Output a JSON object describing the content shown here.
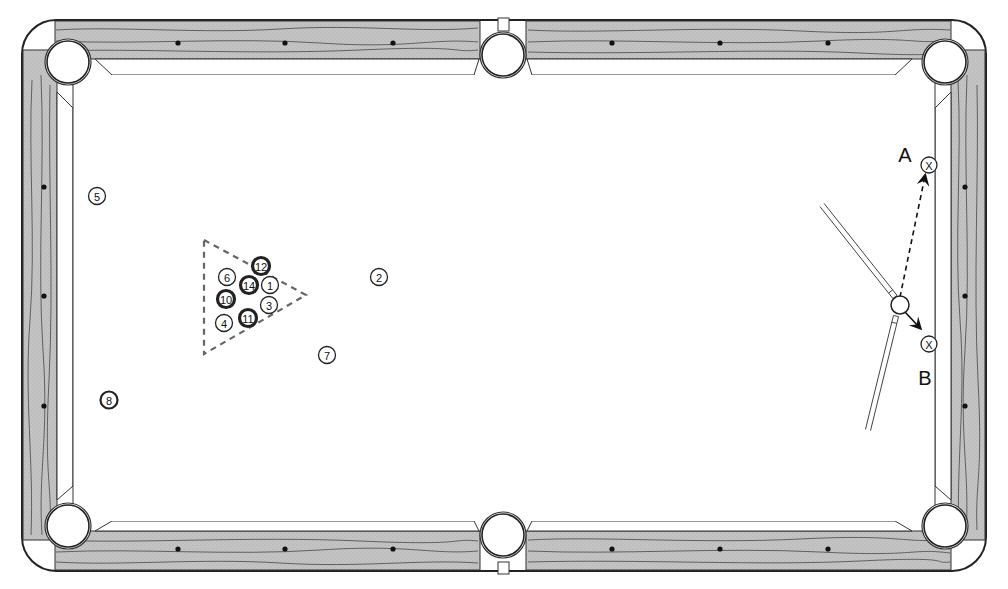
{
  "diagram": {
    "type": "pool-table-shot-diagram",
    "colors": {
      "rail_wood": "#bcbcbc",
      "outline": "#222222",
      "cloth": "#ffffff",
      "solid_ball_fill": "#ffffff",
      "dark_ball_fill": "#222222"
    },
    "pockets": [
      {
        "id": "top-left",
        "x": 68,
        "y": 62
      },
      {
        "id": "top-center",
        "x": 503,
        "y": 55
      },
      {
        "id": "top-right",
        "x": 945,
        "y": 62
      },
      {
        "id": "bottom-left",
        "x": 68,
        "y": 526
      },
      {
        "id": "bottom-center",
        "x": 503,
        "y": 535
      },
      {
        "id": "bottom-right",
        "x": 945,
        "y": 526
      }
    ],
    "balls": [
      {
        "number": "5",
        "x": 97,
        "y": 196,
        "style": "outline"
      },
      {
        "number": "8",
        "x": 109,
        "y": 400,
        "style": "bold"
      },
      {
        "number": "12",
        "x": 261,
        "y": 266,
        "style": "dark-ring"
      },
      {
        "number": "6",
        "x": 227,
        "y": 277,
        "style": "outline"
      },
      {
        "number": "14",
        "x": 249,
        "y": 285,
        "style": "dark-ring"
      },
      {
        "number": "1",
        "x": 270,
        "y": 285,
        "style": "outline"
      },
      {
        "number": "10",
        "x": 226,
        "y": 299,
        "style": "dark-ring"
      },
      {
        "number": "3",
        "x": 269,
        "y": 305,
        "style": "outline"
      },
      {
        "number": "4",
        "x": 224,
        "y": 323,
        "style": "outline"
      },
      {
        "number": "11",
        "x": 248,
        "y": 318,
        "style": "dark-ring"
      },
      {
        "number": "2",
        "x": 379,
        "y": 277,
        "style": "outline"
      },
      {
        "number": "7",
        "x": 327,
        "y": 355,
        "style": "outline"
      }
    ],
    "rack": {
      "points": [
        [
          204,
          240
        ],
        [
          306,
          295
        ],
        [
          204,
          354
        ]
      ],
      "style": "dashed"
    },
    "cue_ball": {
      "x": 900,
      "y": 305
    },
    "targets": [
      {
        "label": "A",
        "marker": "X",
        "x": 929,
        "y": 165,
        "label_x": 905,
        "label_y": 155
      },
      {
        "label": "B",
        "marker": "X",
        "x": 929,
        "y": 344,
        "label_x": 925,
        "label_y": 378
      }
    ],
    "cue_sticks": [
      {
        "id": "cue-stick-upper",
        "from": [
          822,
          205
        ],
        "to": [
          895,
          297
        ]
      },
      {
        "id": "cue-stick-lower",
        "from": [
          868,
          430
        ],
        "to": [
          896,
          316
        ]
      }
    ],
    "paths": [
      {
        "id": "path-to-A",
        "from": [
          900,
          297
        ],
        "to": [
          925,
          176
        ],
        "style": "dashed-arrow"
      },
      {
        "id": "path-to-B",
        "from": [
          905,
          312
        ],
        "to": [
          920,
          328
        ],
        "style": "arrow"
      }
    ],
    "diamonds": {
      "top": [
        [
          178,
          43
        ],
        [
          285,
          43
        ],
        [
          393,
          43
        ],
        [
          612,
          43
        ],
        [
          720,
          43
        ],
        [
          828,
          43
        ]
      ],
      "bottom": [
        [
          178,
          549
        ],
        [
          285,
          549
        ],
        [
          393,
          549
        ],
        [
          612,
          549
        ],
        [
          720,
          549
        ],
        [
          828,
          549
        ]
      ],
      "left": [
        [
          44,
          187
        ],
        [
          44,
          296
        ],
        [
          44,
          406
        ]
      ],
      "right": [
        [
          965,
          187
        ],
        [
          965,
          296
        ],
        [
          965,
          406
        ]
      ]
    }
  }
}
